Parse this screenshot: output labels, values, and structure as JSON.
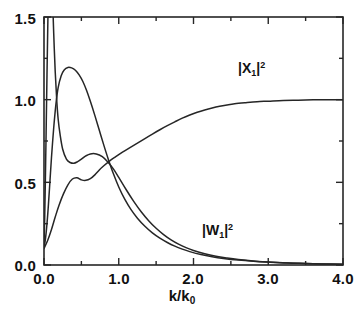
{
  "chart_data": {
    "type": "line",
    "title": "",
    "xlabel": "k/k0",
    "xlabel_display": "k/k",
    "xlabel_sub": "0",
    "ylabel": "",
    "xlim": [
      0.0,
      4.0
    ],
    "ylim": [
      0.0,
      1.5
    ],
    "grid": false,
    "legend_position": "inline-annotations",
    "x_ticks": [
      "0.0",
      "1.0",
      "2.0",
      "3.0",
      "4.0"
    ],
    "x_tick_values": [
      0.0,
      1.0,
      2.0,
      3.0,
      4.0
    ],
    "x_minor_tick_values": [
      0.5,
      1.5,
      2.5,
      3.5
    ],
    "y_ticks": [
      "0.0",
      "0.5",
      "1.0",
      "1.5"
    ],
    "y_tick_values": [
      0.0,
      0.5,
      1.0,
      1.5
    ],
    "y_minor_tick_values": [
      0.25,
      0.75,
      1.25
    ],
    "annotations": [
      {
        "name": "X1-curve-label",
        "text_main": "|X",
        "sub": "1",
        "text_tail": "|",
        "sup": "2",
        "x": 2.55,
        "y": 1.18
      },
      {
        "name": "W1-curve-label",
        "text_main": "|W",
        "sub": "1",
        "text_tail": "|",
        "sup": "2",
        "x": 2.05,
        "y": 0.3
      }
    ],
    "series": [
      {
        "name": "|W1|^2",
        "color": "#262626",
        "points": [
          [
            0.0,
            0.12
          ],
          [
            0.01,
            0.3
          ],
          [
            0.02,
            0.56
          ],
          [
            0.03,
            0.85
          ],
          [
            0.04,
            1.15
          ],
          [
            0.05,
            1.43
          ],
          [
            0.055,
            1.56
          ],
          [
            0.06,
            1.7
          ],
          [
            0.07,
            1.95
          ],
          [
            0.08,
            2.15
          ],
          [
            0.09,
            2.05
          ],
          [
            0.1,
            1.88
          ],
          [
            0.115,
            1.62
          ],
          [
            0.13,
            1.4
          ],
          [
            0.15,
            1.17
          ],
          [
            0.17,
            1.0
          ],
          [
            0.19,
            0.88
          ],
          [
            0.215,
            0.79
          ],
          [
            0.25,
            0.7
          ],
          [
            0.3,
            0.64
          ],
          [
            0.35,
            0.62
          ],
          [
            0.4,
            0.615
          ],
          [
            0.45,
            0.625
          ],
          [
            0.5,
            0.64
          ],
          [
            0.56,
            0.66
          ],
          [
            0.62,
            0.672
          ],
          [
            0.7,
            0.672
          ],
          [
            0.78,
            0.655
          ],
          [
            0.86,
            0.62
          ],
          [
            0.93,
            0.58
          ],
          [
            1.0,
            0.53
          ],
          [
            1.1,
            0.455
          ],
          [
            1.2,
            0.385
          ],
          [
            1.3,
            0.322
          ],
          [
            1.4,
            0.268
          ],
          [
            1.5,
            0.222
          ],
          [
            1.6,
            0.184
          ],
          [
            1.7,
            0.152
          ],
          [
            1.8,
            0.126
          ],
          [
            1.9,
            0.105
          ],
          [
            2.0,
            0.088
          ],
          [
            2.15,
            0.068
          ],
          [
            2.3,
            0.053
          ],
          [
            2.45,
            0.042
          ],
          [
            2.6,
            0.033
          ],
          [
            2.8,
            0.024
          ],
          [
            3.0,
            0.018
          ],
          [
            3.25,
            0.012
          ],
          [
            3.5,
            0.009
          ],
          [
            3.75,
            0.006
          ],
          [
            4.0,
            0.005
          ]
        ]
      },
      {
        "name": "|X1|^2",
        "color": "#262626",
        "points": [
          [
            0.0,
            0.105
          ],
          [
            0.02,
            0.16
          ],
          [
            0.04,
            0.25
          ],
          [
            0.06,
            0.37
          ],
          [
            0.08,
            0.51
          ],
          [
            0.1,
            0.65
          ],
          [
            0.13,
            0.83
          ],
          [
            0.16,
            0.975
          ],
          [
            0.19,
            1.075
          ],
          [
            0.23,
            1.145
          ],
          [
            0.27,
            1.18
          ],
          [
            0.32,
            1.195
          ],
          [
            0.37,
            1.192
          ],
          [
            0.42,
            1.178
          ],
          [
            0.47,
            1.15
          ],
          [
            0.52,
            1.11
          ],
          [
            0.57,
            1.055
          ],
          [
            0.62,
            0.99
          ],
          [
            0.68,
            0.905
          ],
          [
            0.74,
            0.815
          ],
          [
            0.8,
            0.725
          ],
          [
            0.86,
            0.64
          ],
          [
            0.93,
            0.55
          ],
          [
            1.0,
            0.472
          ],
          [
            1.08,
            0.398
          ],
          [
            1.16,
            0.338
          ],
          [
            1.25,
            0.283
          ],
          [
            1.35,
            0.234
          ],
          [
            1.45,
            0.194
          ],
          [
            1.55,
            0.162
          ],
          [
            1.65,
            0.136
          ],
          [
            1.75,
            0.114
          ],
          [
            1.85,
            0.096
          ],
          [
            1.95,
            0.081
          ],
          [
            2.1,
            0.063
          ],
          [
            2.25,
            0.05
          ],
          [
            2.4,
            0.04
          ],
          [
            2.6,
            0.03
          ],
          [
            2.8,
            0.023
          ],
          [
            3.0,
            0.018
          ],
          [
            3.3,
            0.012
          ],
          [
            3.6,
            0.008
          ],
          [
            4.0,
            0.005
          ]
        ]
      },
      {
        "name": "|X1|^2-rising",
        "color": "#262626",
        "points": [
          [
            0.0,
            0.1
          ],
          [
            0.05,
            0.15
          ],
          [
            0.1,
            0.215
          ],
          [
            0.15,
            0.29
          ],
          [
            0.2,
            0.36
          ],
          [
            0.26,
            0.43
          ],
          [
            0.32,
            0.485
          ],
          [
            0.38,
            0.52
          ],
          [
            0.44,
            0.528
          ],
          [
            0.5,
            0.515
          ],
          [
            0.56,
            0.512
          ],
          [
            0.62,
            0.522
          ],
          [
            0.68,
            0.545
          ],
          [
            0.74,
            0.575
          ],
          [
            0.8,
            0.6
          ],
          [
            0.88,
            0.63
          ],
          [
            0.96,
            0.655
          ],
          [
            1.05,
            0.682
          ],
          [
            1.15,
            0.71
          ],
          [
            1.25,
            0.737
          ],
          [
            1.35,
            0.765
          ],
          [
            1.45,
            0.792
          ],
          [
            1.55,
            0.818
          ],
          [
            1.65,
            0.843
          ],
          [
            1.75,
            0.866
          ],
          [
            1.85,
            0.888
          ],
          [
            1.95,
            0.907
          ],
          [
            2.05,
            0.924
          ],
          [
            2.15,
            0.938
          ],
          [
            2.25,
            0.95
          ],
          [
            2.35,
            0.96
          ],
          [
            2.45,
            0.968
          ],
          [
            2.55,
            0.975
          ],
          [
            2.7,
            0.982
          ],
          [
            2.85,
            0.988
          ],
          [
            3.0,
            0.991
          ],
          [
            3.2,
            0.995
          ],
          [
            3.4,
            0.997
          ],
          [
            3.6,
            0.999
          ],
          [
            3.8,
            1.0
          ],
          [
            4.0,
            1.0
          ]
        ]
      }
    ]
  },
  "axes": {
    "x_tick_labels": [
      "0.0",
      "1.0",
      "2.0",
      "3.0",
      "4.0"
    ],
    "y_tick_labels": [
      "1.5",
      "1.0",
      "0.5",
      "0.0"
    ],
    "x_axis_title_main": "k/k",
    "x_axis_title_sub": "0"
  },
  "labels": {
    "x1": {
      "main": "|X",
      "sub": "1",
      "tail": "|",
      "sup": "2"
    },
    "w1": {
      "main": "|W",
      "sub": "1",
      "tail": "|",
      "sup": "2"
    }
  },
  "style": {
    "frame_color": "#262626",
    "curve_color": "#262626",
    "background": "#ffffff"
  }
}
